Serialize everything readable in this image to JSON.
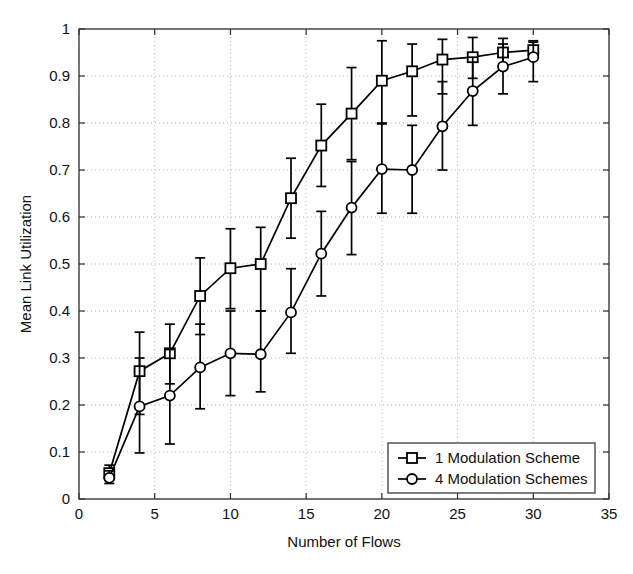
{
  "chart_data": {
    "type": "line",
    "title": "",
    "xlabel": "Number of Flows",
    "ylabel": "Mean Link Utilization",
    "xlim": [
      0,
      35
    ],
    "ylim": [
      0,
      1
    ],
    "xticks": [
      0,
      5,
      10,
      15,
      20,
      25,
      30,
      35
    ],
    "xticklabels": [
      "0",
      "5",
      "10",
      "15",
      "20",
      "25",
      "30",
      "35"
    ],
    "yticks": [
      0,
      0.1,
      0.2,
      0.3,
      0.4,
      0.5,
      0.6,
      0.7,
      0.8,
      0.9,
      1
    ],
    "yticklabels": [
      "0",
      "0.1",
      "0.2",
      "0.3",
      "0.4",
      "0.5",
      "0.6",
      "0.7",
      "0.8",
      "0.9",
      "1"
    ],
    "grid": true,
    "grid_style": "dotted",
    "legend_position": "lower right",
    "x": [
      2,
      4,
      6,
      8,
      10,
      12,
      14,
      16,
      18,
      20,
      22,
      24,
      26,
      28,
      30
    ],
    "series": [
      {
        "name": "1 Modulation Scheme",
        "marker": "square",
        "values": [
          0.055,
          0.272,
          0.31,
          0.432,
          0.491,
          0.5,
          0.64,
          0.752,
          0.82,
          0.89,
          0.91,
          0.935,
          0.94,
          0.95,
          0.955
        ],
        "err_low": [
          0.04,
          0.18,
          0.245,
          0.35,
          0.405,
          0.4,
          0.555,
          0.665,
          0.722,
          0.8,
          0.815,
          0.862,
          0.895,
          0.925,
          0.938
        ],
        "err_high": [
          0.072,
          0.355,
          0.372,
          0.513,
          0.575,
          0.578,
          0.725,
          0.84,
          0.918,
          0.975,
          0.968,
          0.978,
          0.982,
          0.98,
          0.972
        ]
      },
      {
        "name": "4 Modulation Schemes",
        "marker": "circle",
        "values": [
          0.045,
          0.197,
          0.22,
          0.28,
          0.31,
          0.308,
          0.397,
          0.522,
          0.62,
          0.702,
          0.7,
          0.793,
          0.868,
          0.92,
          0.94
        ],
        "err_low": [
          0.033,
          0.098,
          0.117,
          0.192,
          0.22,
          0.228,
          0.31,
          0.432,
          0.52,
          0.608,
          0.608,
          0.7,
          0.795,
          0.862,
          0.888
        ],
        "err_high": [
          0.06,
          0.3,
          0.318,
          0.372,
          0.4,
          0.4,
          0.49,
          0.612,
          0.718,
          0.798,
          0.795,
          0.888,
          0.94,
          0.968,
          0.975
        ]
      }
    ],
    "legend": [
      {
        "label": "1 Modulation Scheme",
        "marker": "square"
      },
      {
        "label": "4 Modulation Schemes",
        "marker": "circle"
      }
    ]
  }
}
